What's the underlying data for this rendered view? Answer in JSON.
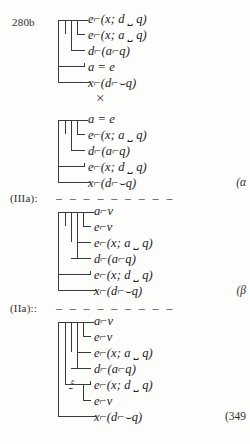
{
  "page": {
    "background_color": "#fdfdfc",
    "ink_color": "#2b2b2b",
    "page_number_label": "(349"
  },
  "glyphs": {
    "negation": "⌐",
    "conditional_hook": "⌣",
    "times": "×",
    "epsilon": "ε",
    "brace": "⎵",
    "dashes": "– – – – – – – – –"
  },
  "blocks": [
    {
      "id": "block-280b",
      "left_label": "280b",
      "right_label": "",
      "rows": [
        {
          "id": "b1r1",
          "text": "e⌐(x; d ⎵ q)",
          "parts": [
            {
              "t": "e",
              "k": "it"
            },
            {
              "t": "⌐",
              "k": "op"
            },
            {
              "t": "(x; d ",
              "k": "it"
            },
            {
              "t": "⎵",
              "k": "und"
            },
            {
              "t": " q)",
              "k": "it"
            }
          ]
        },
        {
          "id": "b1r2",
          "text": "e⌐(x; a ⎵ q)",
          "parts": [
            {
              "t": "e",
              "k": "it"
            },
            {
              "t": "⌐",
              "k": "op"
            },
            {
              "t": "(x; a ",
              "k": "it"
            },
            {
              "t": "⎵",
              "k": "und"
            },
            {
              "t": " q)",
              "k": "it"
            }
          ]
        },
        {
          "id": "b1r3",
          "text": "d⌐(a⌐q)",
          "parts": [
            {
              "t": "d",
              "k": "it"
            },
            {
              "t": "⌐",
              "k": "op"
            },
            {
              "t": "(a",
              "k": "it"
            },
            {
              "t": "⌐",
              "k": "op"
            },
            {
              "t": "q)",
              "k": "it"
            }
          ]
        },
        {
          "id": "b1r4",
          "text": "a = e",
          "parts": [
            {
              "t": "a = e",
              "k": "it"
            }
          ]
        },
        {
          "id": "b1r5",
          "text": "x⌐(d⌐⌣q)",
          "parts": [
            {
              "t": "x",
              "k": "it"
            },
            {
              "t": "⌐",
              "k": "op"
            },
            {
              "t": "(d",
              "k": "it"
            },
            {
              "t": "⌐",
              "k": "op"
            },
            {
              "t": "⌣",
              "k": "cond"
            },
            {
              "t": "q)",
              "k": "it"
            }
          ]
        }
      ]
    },
    {
      "id": "block-alpha",
      "left_label": "",
      "right_label": "(α",
      "rows": [
        {
          "id": "b2r1",
          "text": "a = e",
          "parts": [
            {
              "t": "a = e",
              "k": "it"
            }
          ]
        },
        {
          "id": "b2r2",
          "text": "e⌐(x; a ⎵ q)",
          "parts": [
            {
              "t": "e",
              "k": "it"
            },
            {
              "t": "⌐",
              "k": "op"
            },
            {
              "t": "(x; a ",
              "k": "it"
            },
            {
              "t": "⎵",
              "k": "und"
            },
            {
              "t": " q)",
              "k": "it"
            }
          ]
        },
        {
          "id": "b2r3",
          "text": "d⌐(a⌐q)",
          "parts": [
            {
              "t": "d",
              "k": "it"
            },
            {
              "t": "⌐",
              "k": "op"
            },
            {
              "t": "(a",
              "k": "it"
            },
            {
              "t": "⌐",
              "k": "op"
            },
            {
              "t": "q)",
              "k": "it"
            }
          ]
        },
        {
          "id": "b2r4",
          "text": "e⌐(x; d ⎵ q)",
          "parts": [
            {
              "t": "e",
              "k": "it"
            },
            {
              "t": "⌐",
              "k": "op"
            },
            {
              "t": "(x; d ",
              "k": "it"
            },
            {
              "t": "⎵",
              "k": "und"
            },
            {
              "t": " q)",
              "k": "it"
            }
          ]
        },
        {
          "id": "b2r5",
          "text": "x⌐(d⌐⌣q)",
          "parts": [
            {
              "t": "x",
              "k": "it"
            },
            {
              "t": "⌐",
              "k": "op"
            },
            {
              "t": "(d",
              "k": "it"
            },
            {
              "t": "⌐",
              "k": "op"
            },
            {
              "t": "⌣",
              "k": "cond"
            },
            {
              "t": "q)",
              "k": "it"
            }
          ]
        }
      ]
    },
    {
      "id": "block-beta",
      "left_label": "(IIIa):",
      "right_label": "(β",
      "rows": [
        {
          "id": "b3r1",
          "text": "a⌐v",
          "parts": [
            {
              "t": "a",
              "k": "it"
            },
            {
              "t": "⌐",
              "k": "op"
            },
            {
              "t": "v",
              "k": "it"
            }
          ]
        },
        {
          "id": "b3r2",
          "text": "e⌐v",
          "parts": [
            {
              "t": "e",
              "k": "it"
            },
            {
              "t": "⌐",
              "k": "op"
            },
            {
              "t": "v",
              "k": "it"
            }
          ]
        },
        {
          "id": "b3r3",
          "text": "e⌐(x; a ⎵ q)",
          "parts": [
            {
              "t": "e",
              "k": "it"
            },
            {
              "t": "⌐",
              "k": "op"
            },
            {
              "t": "(x; a ",
              "k": "it"
            },
            {
              "t": "⎵",
              "k": "und"
            },
            {
              "t": " q)",
              "k": "it"
            }
          ]
        },
        {
          "id": "b3r4",
          "text": "d⌐(a⌐q)",
          "parts": [
            {
              "t": "d",
              "k": "it"
            },
            {
              "t": "⌐",
              "k": "op"
            },
            {
              "t": "(a",
              "k": "it"
            },
            {
              "t": "⌐",
              "k": "op"
            },
            {
              "t": "q)",
              "k": "it"
            }
          ]
        },
        {
          "id": "b3r5",
          "text": "e⌐(x; d ⎵ q)",
          "parts": [
            {
              "t": "e",
              "k": "it"
            },
            {
              "t": "⌐",
              "k": "op"
            },
            {
              "t": "(x; d ",
              "k": "it"
            },
            {
              "t": "⎵",
              "k": "und"
            },
            {
              "t": " q)",
              "k": "it"
            }
          ]
        },
        {
          "id": "b3r6",
          "text": "x⌐(d⌐⌣q)",
          "parts": [
            {
              "t": "x",
              "k": "it"
            },
            {
              "t": "⌐",
              "k": "op"
            },
            {
              "t": "(d",
              "k": "it"
            },
            {
              "t": "⌐",
              "k": "op"
            },
            {
              "t": "⌣",
              "k": "cond"
            },
            {
              "t": "q)",
              "k": "it"
            }
          ]
        }
      ]
    },
    {
      "id": "block-349",
      "left_label": "(IIa)::",
      "right_label": "(349",
      "epsilon_annotation": "ε",
      "rows": [
        {
          "id": "b4r1",
          "text": "a⌐v",
          "parts": [
            {
              "t": "a",
              "k": "it"
            },
            {
              "t": "⌐",
              "k": "op"
            },
            {
              "t": "v",
              "k": "it"
            }
          ]
        },
        {
          "id": "b4r2",
          "text": "e⌐v",
          "parts": [
            {
              "t": "e",
              "k": "it"
            },
            {
              "t": "⌐",
              "k": "op"
            },
            {
              "t": "v",
              "k": "it"
            }
          ]
        },
        {
          "id": "b4r3",
          "text": "e⌐(x; a ⎵ q)",
          "parts": [
            {
              "t": "e",
              "k": "it"
            },
            {
              "t": "⌐",
              "k": "op"
            },
            {
              "t": "(x; a ",
              "k": "it"
            },
            {
              "t": "⎵",
              "k": "und"
            },
            {
              "t": " q)",
              "k": "it"
            }
          ]
        },
        {
          "id": "b4r4",
          "text": "d⌐(a⌐q)",
          "parts": [
            {
              "t": "d",
              "k": "it"
            },
            {
              "t": "⌐",
              "k": "op"
            },
            {
              "t": "(a",
              "k": "it"
            },
            {
              "t": "⌐",
              "k": "op"
            },
            {
              "t": "q)",
              "k": "it"
            }
          ]
        },
        {
          "id": "b4r5",
          "text": "e⌐(x; d ⎵ q)",
          "parts": [
            {
              "t": "e",
              "k": "it"
            },
            {
              "t": "⌐",
              "k": "op"
            },
            {
              "t": "(x; d ",
              "k": "it"
            },
            {
              "t": "⎵",
              "k": "und"
            },
            {
              "t": " q)",
              "k": "it"
            }
          ]
        },
        {
          "id": "b4r6",
          "text": "e⌐v",
          "parts": [
            {
              "t": "e",
              "k": "it"
            },
            {
              "t": "⌐",
              "k": "op"
            },
            {
              "t": "v",
              "k": "it"
            }
          ]
        },
        {
          "id": "b4r7",
          "text": "x⌐(d⌐⌣q)",
          "parts": [
            {
              "t": "x",
              "k": "it"
            },
            {
              "t": "⌐",
              "k": "op"
            },
            {
              "t": "(d",
              "k": "it"
            },
            {
              "t": "⌐",
              "k": "op"
            },
            {
              "t": "⌣",
              "k": "cond"
            },
            {
              "t": "q)",
              "k": "it"
            }
          ]
        }
      ]
    }
  ],
  "separator_marks": {
    "times_symbol": "×",
    "dash_run": "– – – – – – – – –"
  }
}
